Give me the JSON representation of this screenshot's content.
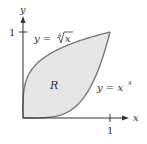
{
  "figure": {
    "type": "region-between-curves",
    "region_label": "R",
    "curves": [
      {
        "name": "upper",
        "equation_lhs": "y = ",
        "root_index": "4",
        "radicand": "x",
        "full_text": "y = ∜x",
        "fn": "root4"
      },
      {
        "name": "lower",
        "equation_lhs": "y = x",
        "exponent": "4",
        "full_text": "y = x^4",
        "fn": "pow4"
      }
    ],
    "axes": {
      "x_label": "x",
      "y_label": "y",
      "x_tick_label": "1",
      "y_tick_label": "1"
    },
    "colors": {
      "fill": "#e6e6e6",
      "curve": "#7a7a7a",
      "axis": "#333333"
    },
    "geometry": {
      "origin_px": [
        23,
        118
      ],
      "unit_px": [
        87,
        86
      ]
    }
  }
}
